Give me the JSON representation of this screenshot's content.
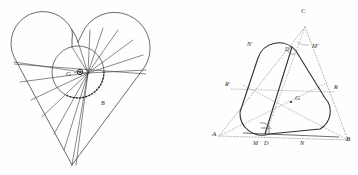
{
  "figure": {
    "title": "",
    "background_color": "#fefefe",
    "stroke_color": "#333333",
    "dotted_color": "#8a8a8a",
    "label_color": "#2a2a2a",
    "panels": [
      {
        "name": "heart-figure",
        "description": "Heart-shaped curve with radiating chords and an inscribed circle",
        "labels": [
          {
            "id": "left-G",
            "text": "G",
            "x": 70,
            "y": 73
          },
          {
            "id": "left-B",
            "text": "B",
            "x": 103,
            "y": 103
          }
        ],
        "points": {
          "center_marker": {
            "x": 80,
            "y": 72
          },
          "fan_origin": {
            "x": 88,
            "y": 73
          },
          "bottom_tip": {
            "x": 72,
            "y": 165
          },
          "circle_center": {
            "x": 78,
            "y": 72
          },
          "circle_radius": 26
        }
      },
      {
        "name": "rounded-triangle-figure",
        "description": "Reuleaux-style rounded triangle inscribed in dotted triangle ABC with centroid G",
        "labels": [
          {
            "id": "right-C",
            "text": "C",
            "x": 124,
            "y": 10
          },
          {
            "id": "right-A",
            "text": "A",
            "x": 36,
            "y": 113
          },
          {
            "id": "right-B",
            "text": "B",
            "x": 168,
            "y": 118
          },
          {
            "id": "right-G",
            "text": "G",
            "x": 114,
            "y": 80
          },
          {
            "id": "right-Nprime",
            "text": "N'",
            "x": 73,
            "y": 41
          },
          {
            "id": "right-Mprime",
            "text": "M'",
            "x": 138,
            "y": 43
          },
          {
            "id": "right-Dprime",
            "text": "D'",
            "x": 113,
            "y": 42
          },
          {
            "id": "right-Rprime",
            "text": "R'",
            "x": 50,
            "y": 78
          },
          {
            "id": "right-R",
            "text": "R",
            "x": 158,
            "y": 80
          },
          {
            "id": "right-M",
            "text": "M",
            "x": 78,
            "y": 138
          },
          {
            "id": "right-D",
            "text": "D",
            "x": 88,
            "y": 139
          },
          {
            "id": "right-N",
            "text": "N",
            "x": 124,
            "y": 138
          }
        ],
        "triangle_vertices": {
          "A": {
            "x": 40,
            "y": 136
          },
          "B": {
            "x": 169,
            "y": 140
          },
          "C": {
            "x": 126,
            "y": 27
          }
        },
        "centroid": {
          "x": 112,
          "y": 102
        }
      }
    ]
  }
}
